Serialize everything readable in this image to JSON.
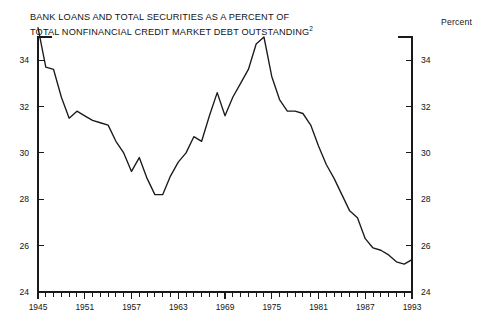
{
  "header": {
    "title_line1": "BANK LOANS AND TOTAL SECURITIES AS A PERCENT OF",
    "title_line2": "TOTAL NONFINANCIAL CREDIT MARKET DEBT OUTSTANDING",
    "title_footnote_marker": "2",
    "unit_label": "Percent"
  },
  "chart_data": {
    "type": "line",
    "xlabel": "",
    "ylabel": "Percent",
    "grid": false,
    "legend": "none",
    "xlim": [
      1945,
      1993
    ],
    "ylim": [
      24,
      35
    ],
    "y_ticks_major": [
      24,
      26,
      28,
      30,
      32,
      34
    ],
    "y_ticks_major_labels": [
      "24",
      "26",
      "28",
      "30",
      "32",
      "34"
    ],
    "y_ticks_minor": [
      25,
      27,
      29,
      31,
      33
    ],
    "y_axis_labels_both_sides": true,
    "x_ticks_major": [
      1945,
      1951,
      1957,
      1963,
      1969,
      1975,
      1981,
      1987,
      1993
    ],
    "x_ticks_major_labels": [
      "1945",
      "1951",
      "1957",
      "1963",
      "1969",
      "1975",
      "1981",
      "1987",
      "1993"
    ],
    "x_tick_interval_minor": 1,
    "line_color": "#1a1a1a",
    "series": [
      {
        "name": "Bank loans and total securities as a percent of total nonfinancial credit market debt outstanding",
        "x": [
          1945,
          1946,
          1947,
          1948,
          1949,
          1950,
          1951,
          1952,
          1953,
          1954,
          1955,
          1956,
          1957,
          1958,
          1959,
          1960,
          1961,
          1962,
          1963,
          1964,
          1965,
          1966,
          1967,
          1968,
          1969,
          1970,
          1971,
          1972,
          1973,
          1974,
          1975,
          1976,
          1977,
          1978,
          1979,
          1980,
          1981,
          1982,
          1983,
          1984,
          1985,
          1986,
          1987,
          1988,
          1989,
          1990,
          1991,
          1992,
          1993
        ],
        "values": [
          35.4,
          33.7,
          33.6,
          32.4,
          31.5,
          31.8,
          31.6,
          31.4,
          31.3,
          31.2,
          30.5,
          30.0,
          29.2,
          29.8,
          28.9,
          28.2,
          28.2,
          29.0,
          29.6,
          30.0,
          30.7,
          30.5,
          31.6,
          32.6,
          31.6,
          32.4,
          33.0,
          33.6,
          34.7,
          35.0,
          33.3,
          32.3,
          31.8,
          31.8,
          31.7,
          31.2,
          30.3,
          29.5,
          28.9,
          28.2,
          27.5,
          27.2,
          26.3,
          25.9,
          25.8,
          25.6,
          25.3,
          25.2,
          25.4
        ]
      }
    ]
  },
  "layout": {
    "plot_left_px": 38,
    "plot_right_px": 412,
    "plot_top_px": 37,
    "plot_bottom_px": 292
  }
}
